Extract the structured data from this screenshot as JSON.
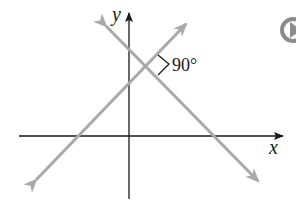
{
  "diagram": {
    "x_axis_label": "x",
    "y_axis_label": "y",
    "angle_label": "90°",
    "line_color": "#a9a9a9",
    "axis_color": "#1a1a1a",
    "lines": [
      {
        "name": "rising-line",
        "slope": "positive"
      },
      {
        "name": "falling-line",
        "slope": "negative"
      }
    ],
    "angle_between_lines": 90
  },
  "controls": {
    "play_icon": "play-circle-icon"
  }
}
